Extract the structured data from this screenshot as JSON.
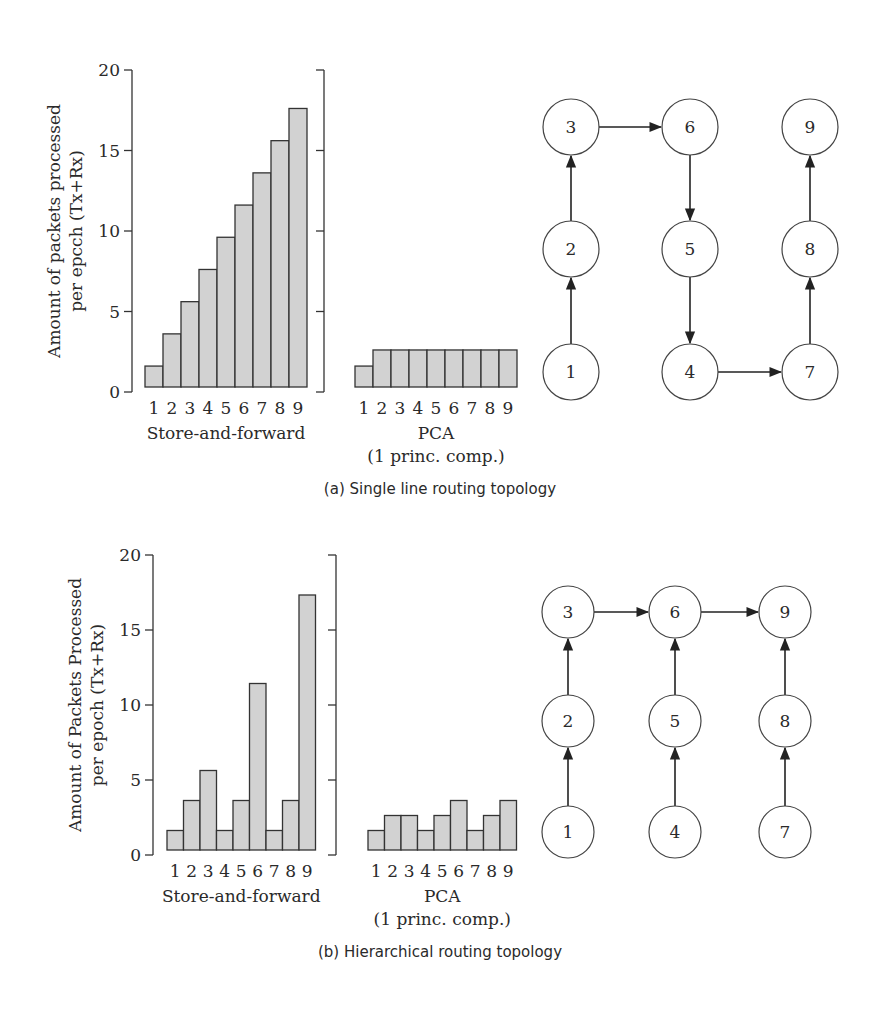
{
  "figures": [
    {
      "id": "a",
      "caption": "(a) Single line routing topology",
      "y_axis_title_line1": "Amount of packets processed",
      "y_axis_title_line2": "per epcch  (Tx+Rx)",
      "store_label": "Store-and-forward",
      "pca_label_line1": "PCA",
      "pca_label_line2": "(1 princ. comp.)",
      "layout": {
        "axis_x": 132,
        "bracket_x": 324,
        "y_top": 70,
        "y_bottom": 392,
        "bars_start_x": 145,
        "bar_w": 18,
        "bar_bottom": 387,
        "pca_start_x": 355,
        "pca_bar_w": 18
      },
      "graph": {
        "cols": [
          571,
          690,
          810
        ],
        "rows": [
          127,
          249,
          372
        ],
        "r": 28,
        "nodes": [
          {
            "id": "1",
            "col": 0,
            "row": 2
          },
          {
            "id": "2",
            "col": 0,
            "row": 1
          },
          {
            "id": "3",
            "col": 0,
            "row": 0
          },
          {
            "id": "4",
            "col": 1,
            "row": 2
          },
          {
            "id": "5",
            "col": 1,
            "row": 1
          },
          {
            "id": "6",
            "col": 1,
            "row": 0
          },
          {
            "id": "7",
            "col": 2,
            "row": 2
          },
          {
            "id": "8",
            "col": 2,
            "row": 1
          },
          {
            "id": "9",
            "col": 2,
            "row": 0
          }
        ],
        "edges": [
          [
            "1",
            "2"
          ],
          [
            "2",
            "3"
          ],
          [
            "3",
            "6"
          ],
          [
            "6",
            "5"
          ],
          [
            "5",
            "4"
          ],
          [
            "4",
            "7"
          ],
          [
            "7",
            "8"
          ],
          [
            "8",
            "9"
          ]
        ]
      }
    },
    {
      "id": "b",
      "caption": "(b) Hierarchical routing topology",
      "y_axis_title_line1": "Amount of Packets Processed",
      "y_axis_title_line2": "per epoch  (Tx+Rx)",
      "store_label": "Store-and-forward",
      "pca_label_line1": "PCA",
      "pca_label_line2": "(1 princ. comp.)",
      "layout": {
        "axis_x": 153,
        "bracket_x": 336,
        "y_top": 555,
        "y_bottom": 855,
        "bars_start_x": 167,
        "bar_w": 16.5,
        "bar_bottom": 850,
        "pca_start_x": 368,
        "pca_bar_w": 16.5
      },
      "graph": {
        "cols": [
          568,
          675,
          785
        ],
        "rows": [
          612,
          721,
          832
        ],
        "r": 26,
        "nodes": [
          {
            "id": "1",
            "col": 0,
            "row": 2
          },
          {
            "id": "2",
            "col": 0,
            "row": 1
          },
          {
            "id": "3",
            "col": 0,
            "row": 0
          },
          {
            "id": "4",
            "col": 1,
            "row": 2
          },
          {
            "id": "5",
            "col": 1,
            "row": 1
          },
          {
            "id": "6",
            "col": 1,
            "row": 0
          },
          {
            "id": "7",
            "col": 2,
            "row": 2
          },
          {
            "id": "8",
            "col": 2,
            "row": 1
          },
          {
            "id": "9",
            "col": 2,
            "row": 0
          }
        ],
        "edges": [
          [
            "1",
            "2"
          ],
          [
            "2",
            "3"
          ],
          [
            "4",
            "5"
          ],
          [
            "5",
            "6"
          ],
          [
            "7",
            "8"
          ],
          [
            "8",
            "9"
          ],
          [
            "3",
            "6"
          ],
          [
            "6",
            "9"
          ]
        ]
      }
    }
  ],
  "chart_data": [
    {
      "type": "bar",
      "title": "Store-and-forward (a) Single line routing topology",
      "xlabel": "Store-and-forward",
      "ylabel": "Amount of packets processed per epcch (Tx+Rx)",
      "categories": [
        "1",
        "2",
        "3",
        "4",
        "5",
        "6",
        "7",
        "8",
        "9"
      ],
      "values": [
        1.3,
        3.3,
        5.3,
        7.3,
        9.3,
        11.3,
        13.3,
        15.3,
        17.3
      ],
      "yticks": [
        0,
        5,
        10,
        15,
        20
      ],
      "ylim": [
        0,
        20
      ]
    },
    {
      "type": "bar",
      "title": "PCA (a) Single line routing topology",
      "xlabel": "PCA (1 princ. comp.)",
      "ylabel": "Amount of packets processed per epcch (Tx+Rx)",
      "categories": [
        "1",
        "2",
        "3",
        "4",
        "5",
        "6",
        "7",
        "8",
        "9"
      ],
      "values": [
        1.3,
        2.3,
        2.3,
        2.3,
        2.3,
        2.3,
        2.3,
        2.3,
        2.3
      ],
      "ylim": [
        0,
        20
      ]
    },
    {
      "type": "bar",
      "title": "Store-and-forward (b) Hierarchical routing topology",
      "xlabel": "Store-and-forward",
      "ylabel": "Amount of Packets Processed per epoch (Tx+Rx)",
      "categories": [
        "1",
        "2",
        "3",
        "4",
        "5",
        "6",
        "7",
        "8",
        "9"
      ],
      "values": [
        1.3,
        3.3,
        5.3,
        1.3,
        3.3,
        11.1,
        1.3,
        3.3,
        17.0
      ],
      "yticks": [
        0,
        5,
        10,
        15,
        20
      ],
      "ylim": [
        0,
        20
      ]
    },
    {
      "type": "bar",
      "title": "PCA (b) Hierarchical routing topology",
      "xlabel": "PCA (1 princ. comp.)",
      "ylabel": "Amount of Packets Processed per epoch (Tx+Rx)",
      "categories": [
        "1",
        "2",
        "3",
        "4",
        "5",
        "6",
        "7",
        "8",
        "9"
      ],
      "values": [
        1.3,
        2.3,
        2.3,
        1.3,
        2.3,
        3.3,
        1.3,
        2.3,
        3.3
      ],
      "ylim": [
        0,
        20
      ]
    }
  ]
}
